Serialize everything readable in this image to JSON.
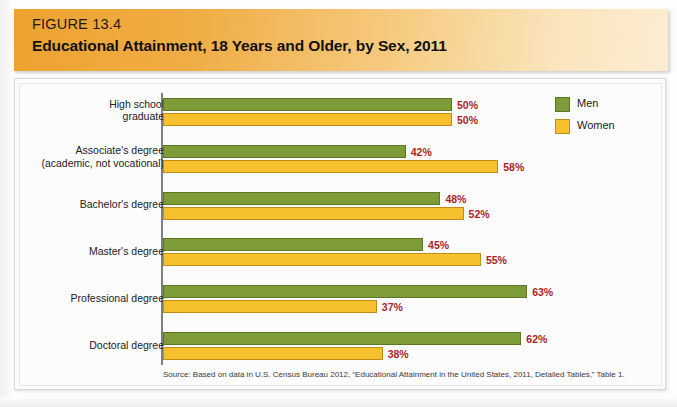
{
  "header": {
    "figure_number": "FIGURE 13.4",
    "title": "Educational Attainment, 18 Years and Older, by Sex, 2011",
    "banner_color_start": "#eda22e",
    "banner_color_end": "#fcecd0"
  },
  "legend": {
    "position": "top-right",
    "items": [
      {
        "label": "Men",
        "color": "#7d9b36"
      },
      {
        "label": "Women",
        "color": "#f6c12c"
      }
    ]
  },
  "source": {
    "text": "Source: Based on data in U.S. Census Bureau 2012, “Educational Attainment in the United States, 2011, Detailed Tables,” Table 1."
  },
  "chart_data": {
    "type": "bar",
    "orientation": "horizontal",
    "title": "Educational Attainment, 18 Years and Older, by Sex, 2011",
    "xlabel": "",
    "ylabel": "",
    "xlim": [
      0,
      100
    ],
    "grid": false,
    "value_suffix": "%",
    "categories": [
      "High school graduate",
      "Associate's degree (academic, not vocational)",
      "Bachelor's degree",
      "Master's degree",
      "Professional degree",
      "Doctoral degree"
    ],
    "category_lines": [
      [
        "High school",
        "graduate"
      ],
      [
        "Associate's degree",
        "(academic, not vocational)"
      ],
      [
        "Bachelor's degree"
      ],
      [
        "Master's degree"
      ],
      [
        "Professional degree"
      ],
      [
        "Doctoral degree"
      ]
    ],
    "series": [
      {
        "name": "Men",
        "color": "#7d9b36",
        "values": [
          50,
          42,
          48,
          45,
          63,
          62
        ],
        "labels": [
          "50%",
          "42%",
          "48%",
          "45%",
          "63%",
          "62%"
        ]
      },
      {
        "name": "Women",
        "color": "#f6c12c",
        "values": [
          50,
          58,
          52,
          55,
          37,
          38
        ],
        "labels": [
          "50%",
          "58%",
          "52%",
          "55%",
          "37%",
          "38%"
        ]
      }
    ],
    "value_label_color": "#ae1f24"
  }
}
